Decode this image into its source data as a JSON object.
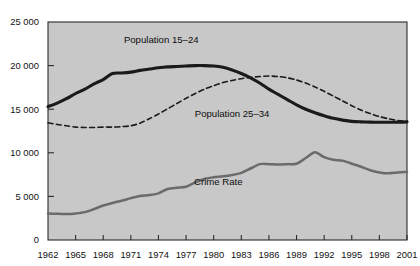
{
  "chart_data": {
    "type": "line",
    "title": "",
    "xlabel": "",
    "ylabel": "",
    "xlim": [
      1962,
      2001
    ],
    "ylim": [
      0,
      25000
    ],
    "grid": false,
    "legend_position": "inline-labels",
    "y_ticks": [
      "0",
      "5 000",
      "10 000",
      "15 000",
      "20 000",
      "25 000"
    ],
    "y_tick_values": [
      0,
      5000,
      10000,
      15000,
      20000,
      25000
    ],
    "x_ticks": [
      "1962",
      "1965",
      "1968",
      "1971",
      "1974",
      "1977",
      "1980",
      "1983",
      "1986",
      "1989",
      "1992",
      "1995",
      "1998",
      "2001"
    ],
    "x_tick_values": [
      1962,
      1965,
      1968,
      1971,
      1974,
      1977,
      1980,
      1983,
      1986,
      1989,
      1992,
      1995,
      1998,
      2001
    ],
    "x": [
      1962,
      1963,
      1964,
      1965,
      1966,
      1967,
      1968,
      1969,
      1970,
      1971,
      1972,
      1973,
      1974,
      1975,
      1976,
      1977,
      1978,
      1979,
      1980,
      1981,
      1982,
      1983,
      1984,
      1985,
      1986,
      1987,
      1988,
      1989,
      1990,
      1991,
      1992,
      1993,
      1994,
      1995,
      1996,
      1997,
      1998,
      1999,
      2000,
      2001
    ],
    "series": [
      {
        "name": "Population 15-24",
        "label": "Population 15–24",
        "style": "solid",
        "color": "#1a1a1a",
        "width": 3.1,
        "label_x": 1974.3,
        "label_y": 22600,
        "values": [
          15300,
          15700,
          16200,
          16800,
          17300,
          17900,
          18400,
          19100,
          19150,
          19250,
          19450,
          19600,
          19750,
          19850,
          19900,
          19950,
          20000,
          20000,
          19950,
          19800,
          19500,
          19100,
          18600,
          18000,
          17300,
          16700,
          16100,
          15500,
          15000,
          14600,
          14250,
          13950,
          13750,
          13600,
          13550,
          13520,
          13500,
          13500,
          13500,
          13550
        ]
      },
      {
        "name": "Population 25-34",
        "label": "Population 25–34",
        "style": "dashed",
        "color": "#1a1a1a",
        "width": 1.6,
        "label_x": 1982.0,
        "label_y": 14050,
        "values": [
          13450,
          13250,
          13100,
          12950,
          12900,
          12900,
          12950,
          12950,
          13000,
          13100,
          13400,
          13900,
          14450,
          15050,
          15650,
          16250,
          16800,
          17300,
          17700,
          18050,
          18300,
          18500,
          18650,
          18750,
          18800,
          18750,
          18600,
          18350,
          18000,
          17550,
          17050,
          16500,
          15950,
          15400,
          14900,
          14500,
          14150,
          13900,
          13700,
          13600
        ]
      },
      {
        "name": "Crime Rate",
        "label": "Crime Rate",
        "style": "solid",
        "color": "#6b6b6b",
        "width": 2.5,
        "label_x": 1980.5,
        "label_y": 6300,
        "values": [
          3050,
          3000,
          2980,
          3050,
          3200,
          3550,
          3950,
          4250,
          4500,
          4800,
          5050,
          5150,
          5350,
          5850,
          6000,
          6100,
          6600,
          7000,
          7200,
          7300,
          7450,
          7700,
          8200,
          8700,
          8700,
          8650,
          8700,
          8750,
          9400,
          10050,
          9500,
          9200,
          9100,
          8750,
          8400,
          8000,
          7750,
          7650,
          7750,
          7800
        ]
      }
    ]
  },
  "axes": {
    "plot_background": "#c8c8c8",
    "border_color": "#2b2b2b",
    "tick_color": "#2b2b2b"
  }
}
